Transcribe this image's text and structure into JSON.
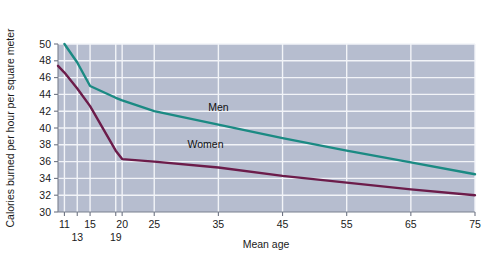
{
  "chart_data": {
    "type": "line",
    "title": "",
    "xlabel": "Mean age",
    "ylabel": "Calories burned per hour per square meter",
    "xlim": [
      10,
      75
    ],
    "ylim": [
      30,
      50
    ],
    "grid": true,
    "legend_position": "inline-annotation",
    "x_ticks": [
      {
        "value": 11,
        "label": "11",
        "row": 0
      },
      {
        "value": 13,
        "label": "13",
        "row": 1
      },
      {
        "value": 15,
        "label": "15",
        "row": 0
      },
      {
        "value": 19,
        "label": "19",
        "row": 1
      },
      {
        "value": 20,
        "label": "20",
        "row": 0
      },
      {
        "value": 25,
        "label": "25",
        "row": 0
      },
      {
        "value": 35,
        "label": "35",
        "row": 0
      },
      {
        "value": 45,
        "label": "45",
        "row": 0
      },
      {
        "value": 55,
        "label": "55",
        "row": 0
      },
      {
        "value": 65,
        "label": "65",
        "row": 0
      },
      {
        "value": 75,
        "label": "75",
        "row": 0
      }
    ],
    "y_ticks": [
      {
        "value": 30,
        "label": "30"
      },
      {
        "value": 32,
        "label": "32"
      },
      {
        "value": 34,
        "label": "34"
      },
      {
        "value": 36,
        "label": "36"
      },
      {
        "value": 38,
        "label": "38"
      },
      {
        "value": 40,
        "label": "40"
      },
      {
        "value": 42,
        "label": "42"
      },
      {
        "value": 44,
        "label": "44"
      },
      {
        "value": 46,
        "label": "46"
      },
      {
        "value": 48,
        "label": "48"
      },
      {
        "value": 50,
        "label": "50"
      }
    ],
    "series": [
      {
        "name": "Men",
        "color": "#1b8a83",
        "label_x": 35,
        "label_y": 42.0,
        "points": [
          {
            "x": 11,
            "y": 50.0
          },
          {
            "x": 13,
            "y": 47.8
          },
          {
            "x": 15,
            "y": 45.0
          },
          {
            "x": 19,
            "y": 43.6
          },
          {
            "x": 20,
            "y": 43.3
          },
          {
            "x": 25,
            "y": 42.0
          },
          {
            "x": 35,
            "y": 40.4
          },
          {
            "x": 45,
            "y": 38.8
          },
          {
            "x": 55,
            "y": 37.3
          },
          {
            "x": 65,
            "y": 35.9
          },
          {
            "x": 75,
            "y": 34.5
          }
        ]
      },
      {
        "name": "Women",
        "color": "#6c1c4a",
        "label_x": 33,
        "label_y": 37.6,
        "points": [
          {
            "x": 10,
            "y": 47.4
          },
          {
            "x": 11,
            "y": 46.6
          },
          {
            "x": 13,
            "y": 44.7
          },
          {
            "x": 15,
            "y": 42.6
          },
          {
            "x": 19,
            "y": 37.3
          },
          {
            "x": 20,
            "y": 36.3
          },
          {
            "x": 25,
            "y": 36.0
          },
          {
            "x": 35,
            "y": 35.3
          },
          {
            "x": 45,
            "y": 34.3
          },
          {
            "x": 55,
            "y": 33.5
          },
          {
            "x": 65,
            "y": 32.7
          },
          {
            "x": 75,
            "y": 32.0
          }
        ]
      }
    ]
  },
  "plot": {
    "background_color": "#b6bdcf",
    "gridline_color": "#f2f4f8",
    "axis_color": "#7b8190"
  }
}
